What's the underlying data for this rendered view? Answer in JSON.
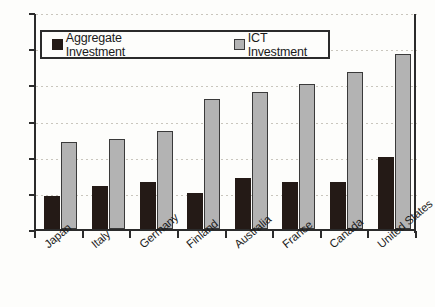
{
  "chart_data": {
    "type": "bar",
    "title": "",
    "xlabel": "",
    "ylabel": "",
    "ylim": [
      0,
      6
    ],
    "ytick_step": 1,
    "ytick_labels": [
      "0.0",
      "1.0",
      "2.0",
      "3.0",
      "4.0",
      "5.0",
      "6.0"
    ],
    "grid": true,
    "legend_position": "top-inside",
    "categories": [
      "Japan",
      "Italy",
      "Germany",
      "Finland",
      "Australia",
      "France",
      "Canada",
      "United States"
    ],
    "series": [
      {
        "name": "Aggregate Investment",
        "color": "#241a16",
        "values": [
          0.9,
          1.2,
          1.3,
          1.0,
          1.4,
          1.3,
          1.3,
          2.0
        ]
      },
      {
        "name": "ICT Investment",
        "color": "#b3b3b3",
        "values": [
          2.4,
          2.5,
          2.7,
          3.6,
          3.8,
          4.0,
          4.35,
          4.85
        ]
      }
    ]
  },
  "legend": {
    "entries": [
      {
        "label": "Aggregate Investment",
        "swatch": "aggregate-swatch"
      },
      {
        "label": "ICT Investment",
        "swatch": "ict-swatch"
      }
    ]
  },
  "colors": {
    "aggregate": "#241a16",
    "ict": "#b3b3b3",
    "axis": "#2b2b2b",
    "grid": "#c9c6bd",
    "background": "#fdfdfb"
  }
}
